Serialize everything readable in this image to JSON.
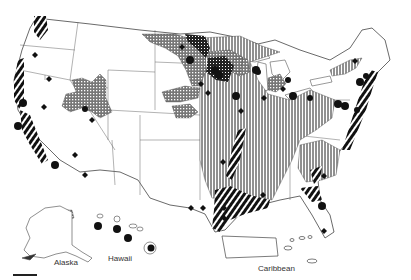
{
  "map": {
    "title": "",
    "insets": [
      {
        "label": "Alaska"
      },
      {
        "label": "Hawaii"
      },
      {
        "label": "Caribbean"
      }
    ],
    "colors": {
      "ink": "#1a1a1a",
      "background": "#ffffff",
      "border": "#555555"
    },
    "symbols": [
      {
        "name": "vertical-hatch-region",
        "description": "vertically hatched area (Midwest / Plains / Southeast)"
      },
      {
        "name": "crosshatch-region",
        "description": "stippled cross-hatch area (Upper Midwest, Great Basin, Montana)"
      },
      {
        "name": "diagonal-stripe-band",
        "description": "bold diagonal stripe bands along coasts"
      },
      {
        "name": "circle-marker",
        "description": "solid black circle"
      },
      {
        "name": "diamond-marker",
        "description": "solid black diamond"
      }
    ]
  }
}
